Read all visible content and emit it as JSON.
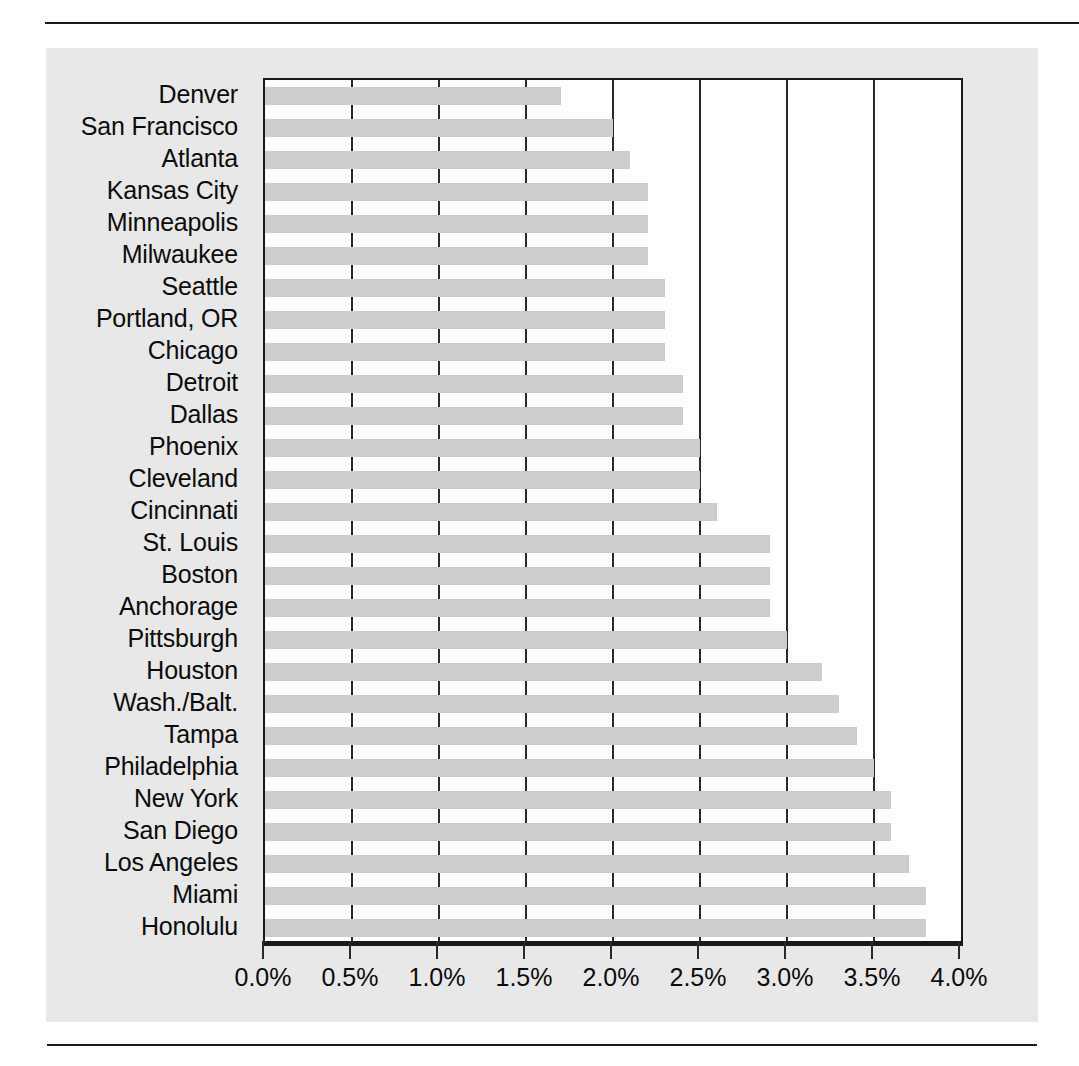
{
  "chart_data": {
    "type": "bar",
    "orientation": "horizontal",
    "title": "",
    "subtitle": "",
    "xlabel": "",
    "ylabel": "",
    "xlim": [
      0.0,
      4.0
    ],
    "xticks": [
      0.0,
      0.5,
      1.0,
      1.5,
      2.0,
      2.5,
      3.0,
      3.5,
      4.0
    ],
    "xticklabels": [
      "0.0%",
      "0.5%",
      "1.0%",
      "1.5%",
      "2.0%",
      "2.5%",
      "3.0%",
      "3.5%",
      "4.0%"
    ],
    "grid": "vertical",
    "legend": "none",
    "bar_color": "#cdcdcd",
    "axis_color": "#1a1a1a",
    "panel_color": "#e8e8e8",
    "categories": [
      "Denver",
      "San Francisco",
      "Atlanta",
      "Kansas City",
      "Minneapolis",
      "Milwaukee",
      "Seattle",
      "Portland, OR",
      "Chicago",
      "Detroit",
      "Dallas",
      "Phoenix",
      "Cleveland",
      "Cincinnati",
      "St. Louis",
      "Boston",
      "Anchorage",
      "Pittsburgh",
      "Houston",
      "Wash./Balt.",
      "Tampa",
      "Philadelphia",
      "New York",
      "San Diego",
      "Los Angeles",
      "Miami",
      "Honolulu"
    ],
    "values": [
      1.7,
      2.0,
      2.1,
      2.2,
      2.2,
      2.2,
      2.3,
      2.3,
      2.3,
      2.4,
      2.4,
      2.5,
      2.5,
      2.6,
      2.9,
      2.9,
      2.9,
      3.0,
      3.2,
      3.3,
      3.4,
      3.5,
      3.6,
      3.6,
      3.7,
      3.8,
      3.8
    ]
  }
}
